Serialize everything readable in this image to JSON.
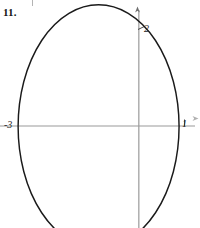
{
  "figure": {
    "problem_number": "11.",
    "stray_mark": "tick-artifact"
  },
  "labels": {
    "y_intercept": "2",
    "x_intercept_left": "-3",
    "x_intercept_right": "1"
  },
  "colors": {
    "curve": "#1a1a1a",
    "axis": "#9a9a9a",
    "background": "#ffffff",
    "text": "#121212"
  },
  "chart_data": {
    "type": "line",
    "title": "",
    "subtitle": "",
    "xlabel": "",
    "ylabel": "",
    "grid": false,
    "legend": null,
    "xlim": [
      -3.45,
      1.52
    ],
    "ylim": [
      -2.0,
      2.47
    ],
    "axes": {
      "x_axis": {
        "visible": true,
        "arrow": "right",
        "y_value": 0
      },
      "y_axis": {
        "visible": true,
        "arrow": "up",
        "x_value": 0
      }
    },
    "tick_labels": {
      "x": [
        {
          "value": -3,
          "label": "-3"
        },
        {
          "value": 1,
          "label": "1"
        }
      ],
      "y": [
        {
          "value": 2,
          "label": "2"
        }
      ]
    },
    "annotations": [
      {
        "text": "11.",
        "role": "problem-number",
        "x_px": 3,
        "y_px": 7
      },
      {
        "text": "-3",
        "role": "x-intercept-label",
        "value": -3
      },
      {
        "text": "1",
        "role": "x-intercept-label",
        "value": 1
      },
      {
        "text": "2",
        "role": "y-intercept-label",
        "value": 2
      }
    ],
    "series": [
      {
        "name": "ellipse",
        "shape": "ellipse",
        "closed": true,
        "center": [
          -1,
          -0.0125
        ],
        "semi_axis_x": 2,
        "semi_axis_y": 2.3875,
        "x_intercepts": [
          -3,
          1
        ],
        "y_intercepts": [
          2,
          -2
        ],
        "equation": "(x+1)^2/4 + y^2/5.7 = 1"
      }
    ]
  }
}
